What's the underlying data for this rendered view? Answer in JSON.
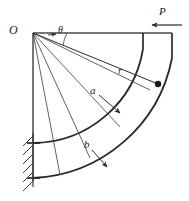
{
  "figure": {
    "type": "engineering-mechanics-diagram",
    "top_caption": "",
    "bottom_caption": "",
    "background_color": "#ffffff",
    "line_color": "#2a2a2a"
  },
  "labels": {
    "origin": "O",
    "force": "P",
    "radius_variable": "r",
    "inner_radius": "a",
    "outer_radius": "b",
    "angle": "θ"
  },
  "geometry": {
    "origin_x": 33,
    "origin_y": 33,
    "inner_radius_px": 110,
    "outer_radius_px": 144,
    "arc_start_angle_deg": 0,
    "arc_end_angle_deg": 90,
    "point_r_angle_deg": 25,
    "point_r_distance_px": 128,
    "radial_fan_angles_deg": [
      8,
      25,
      45,
      62,
      78
    ],
    "hatch_count": 6
  },
  "annotations": [
    {
      "name": "force-P",
      "label": "P",
      "direction": "left",
      "x": 163,
      "y": 11
    },
    {
      "name": "angle-theta",
      "label": "θ",
      "x": 58,
      "y": 28
    },
    {
      "name": "radius-r",
      "label": "r",
      "x": 120,
      "y": 72
    },
    {
      "name": "dim-a",
      "label": "a",
      "x": 94,
      "y": 92
    },
    {
      "name": "dim-b",
      "label": "b",
      "x": 88,
      "y": 147
    },
    {
      "name": "origin-O",
      "label": "O",
      "x": 11,
      "y": 26
    }
  ]
}
